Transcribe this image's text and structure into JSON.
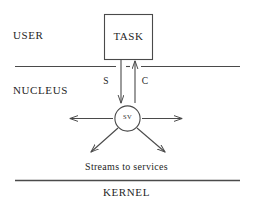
{
  "diagram": {
    "background_color": "#ffffff",
    "line_color": "#4a4a4a",
    "text_color": "#1f1f1f"
  },
  "layers": {
    "user_label": "USER",
    "nucleus_label": "NUCLEUS",
    "kernel_label": "KERNEL"
  },
  "nodes": {
    "task_label": "TASK",
    "sv_label": "SV",
    "streams_label": "Streams to services"
  },
  "edges": {
    "send_label": "S",
    "call_label": "C"
  }
}
